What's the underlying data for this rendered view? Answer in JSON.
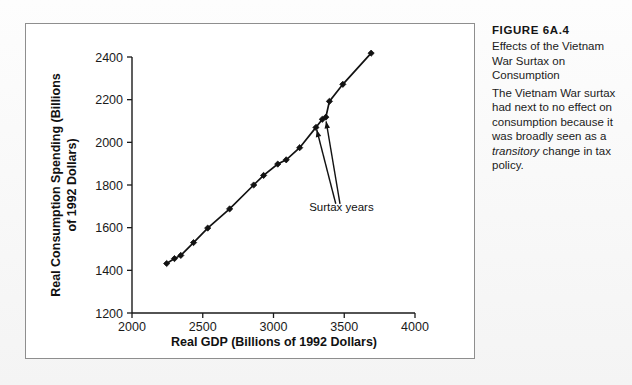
{
  "caption": {
    "figure_number": "FIGURE 6A.4",
    "title": "Effects of the Vietnam War Surtax on Consumption",
    "description_part1": "The Vietnam War surtax had next to no effect on consumption because it was broadly seen as a ",
    "description_emphasis": "transitory",
    "description_part2": " change in tax policy."
  },
  "chart_data": {
    "type": "line",
    "title": "",
    "xlabel": "Real GDP (Billions of 1992 Dollars)",
    "ylabel": "Real Consumption Spending (Billions of 1992 Dollars)",
    "xlim": [
      2000,
      4000
    ],
    "ylim": [
      1200,
      2400
    ],
    "xticks": [
      2000,
      2500,
      3000,
      3500,
      4000
    ],
    "yticks": [
      1200,
      1400,
      1600,
      1800,
      2000,
      2200,
      2400
    ],
    "grid": false,
    "legend": "none",
    "marker": "diamond",
    "series": [
      {
        "name": "Consumption vs GDP",
        "x": [
          2245,
          2300,
          2345,
          2435,
          2535,
          2690,
          2860,
          2930,
          3030,
          3090,
          3185,
          3300,
          3345,
          3370,
          3395,
          3490,
          3690
        ],
        "y": [
          1432,
          1455,
          1470,
          1530,
          1598,
          1688,
          1800,
          1845,
          1898,
          1918,
          1975,
          2070,
          2108,
          2118,
          2192,
          2272,
          2418
        ]
      }
    ],
    "annotations": [
      {
        "label": "Surtax years",
        "label_x": 3480,
        "label_y": 1678,
        "arrows": [
          {
            "from_x": 3440,
            "from_y": 1712,
            "to_x": 3306,
            "to_y": 2058
          },
          {
            "from_x": 3470,
            "from_y": 1712,
            "to_x": 3372,
            "to_y": 2098
          }
        ]
      }
    ]
  }
}
